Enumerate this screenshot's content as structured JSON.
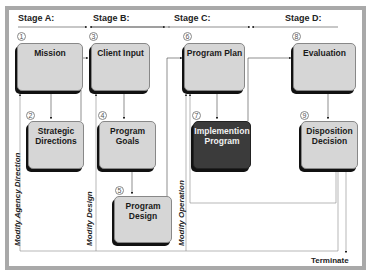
{
  "diagram": {
    "stages": [
      {
        "id": "A",
        "label": "Stage A:"
      },
      {
        "id": "B",
        "label": "Stage B:"
      },
      {
        "id": "C",
        "label": "Stage C:"
      },
      {
        "id": "D",
        "label": "Stage D:"
      }
    ],
    "boxes": [
      {
        "num": "1",
        "label": "Mission",
        "stage": "A"
      },
      {
        "num": "2",
        "label": "Strategic Directions",
        "stage": "A"
      },
      {
        "num": "3",
        "label": "Client Input",
        "stage": "B"
      },
      {
        "num": "4",
        "label": "Program Goals",
        "stage": "B"
      },
      {
        "num": "5",
        "label": "Program Design",
        "stage": "B"
      },
      {
        "num": "6",
        "label": "Program Plan",
        "stage": "C"
      },
      {
        "num": "7",
        "label": "Implemention Program",
        "stage": "C",
        "highlighted": true
      },
      {
        "num": "8",
        "label": "Evaluation",
        "stage": "D"
      },
      {
        "num": "9",
        "label": "Disposition Decision",
        "stage": "D"
      }
    ],
    "feedback_labels": [
      {
        "label": "Modify Agency Direction"
      },
      {
        "label": "Modify Design"
      },
      {
        "label": "Modify Operation"
      }
    ],
    "terminal": {
      "label": "Terminate"
    },
    "colors": {
      "box_fill": "#d6d6d6",
      "highlight_fill": "#3b3b3b",
      "frame_border": "#a9a9a9",
      "shadow": "#111111"
    }
  }
}
